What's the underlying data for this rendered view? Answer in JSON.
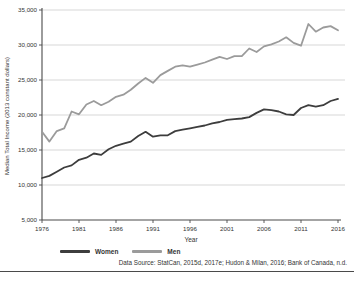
{
  "chart_data": {
    "type": "line",
    "title": "",
    "xlabel": "Year",
    "ylabel": "Median Total Income (2013 constant dollars)",
    "xlim": [
      1976,
      2016
    ],
    "ylim": [
      5000,
      35000
    ],
    "xticks": [
      1976,
      1981,
      1986,
      1991,
      1996,
      2001,
      2006,
      2011,
      2016
    ],
    "yticks": [
      5000,
      10000,
      15000,
      20000,
      25000,
      30000,
      35000
    ],
    "ytick_labels": [
      "5,000",
      "10,000",
      "15,000",
      "20,000",
      "25,000",
      "30,000",
      "35,000"
    ],
    "grid": "horizontal",
    "legend_position": "bottom",
    "x": [
      1976,
      1977,
      1978,
      1979,
      1980,
      1981,
      1982,
      1983,
      1984,
      1985,
      1986,
      1987,
      1988,
      1989,
      1990,
      1991,
      1992,
      1993,
      1994,
      1995,
      1996,
      1997,
      1998,
      1999,
      2000,
      2001,
      2002,
      2003,
      2004,
      2005,
      2006,
      2007,
      2008,
      2009,
      2010,
      2011,
      2012,
      2013,
      2014,
      2015,
      2016
    ],
    "series": [
      {
        "name": "Women",
        "color": "#3d3d3d",
        "values": [
          11000,
          11300,
          11900,
          12500,
          12800,
          13600,
          13900,
          14500,
          14300,
          15100,
          15600,
          15900,
          16200,
          17000,
          17600,
          16900,
          17100,
          17100,
          17700,
          17900,
          18100,
          18300,
          18500,
          18800,
          19000,
          19300,
          19400,
          19500,
          19700,
          20300,
          20800,
          20700,
          20500,
          20100,
          20000,
          21000,
          21400,
          21200,
          21400,
          22000,
          22300
        ]
      },
      {
        "name": "Men",
        "color": "#9b9b9b",
        "values": [
          17600,
          16200,
          17700,
          18100,
          20500,
          20100,
          21500,
          22000,
          21400,
          21900,
          22600,
          22900,
          23600,
          24500,
          25300,
          24600,
          25700,
          26300,
          26900,
          27100,
          26900,
          27200,
          27500,
          27900,
          28300,
          28000,
          28400,
          28400,
          29500,
          29000,
          29800,
          30100,
          30500,
          31100,
          30300,
          29900,
          33000,
          31900,
          32500,
          32700,
          32100
        ]
      }
    ]
  },
  "colors": {
    "grid": "#c9c9c9",
    "axis": "#4a4a4a",
    "tick_text": "#333333"
  },
  "source_note": "Data Source: StatCan, 2015d, 2017e; Hudon & Milan, 2016; Bank of Canada, n.d."
}
